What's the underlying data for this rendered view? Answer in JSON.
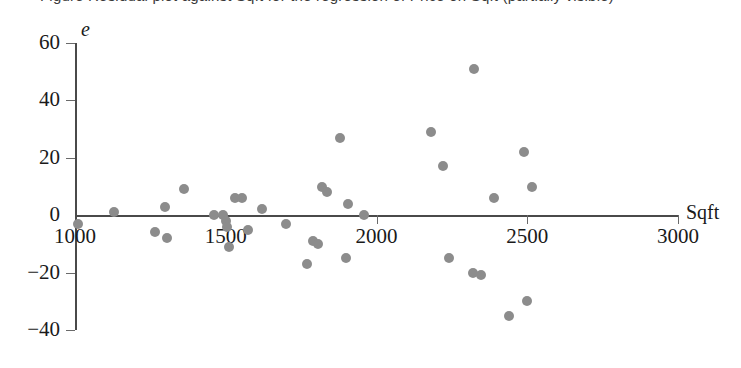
{
  "caption": {
    "text": "Figure  Residual plot against Sqft for the regression of Price on Sqft (partially visible)"
  },
  "chart_data": {
    "type": "scatter",
    "title": "",
    "subtitle": "",
    "xlabel": "Sqft",
    "ylabel": "e",
    "xlim": [
      1000,
      3000
    ],
    "ylim": [
      -40,
      60
    ],
    "xticks": [
      1000,
      1500,
      2000,
      2500,
      3000
    ],
    "xtick_labels": [
      "1000",
      "1500",
      "2000",
      "2500",
      "3000"
    ],
    "yticks": [
      -40,
      -20,
      0,
      20,
      40,
      60
    ],
    "ytick_labels": [
      "−40",
      "−20",
      "0",
      "20",
      "40",
      "60"
    ],
    "grid": false,
    "legend": "none",
    "marker_color": "#8c8c8c",
    "axis_color": "#4a4a4a",
    "series": [
      {
        "name": "residuals",
        "points": [
          {
            "x": 1010,
            "y": -3
          },
          {
            "x": 1130,
            "y": 1
          },
          {
            "x": 1265,
            "y": -6
          },
          {
            "x": 1300,
            "y": 3
          },
          {
            "x": 1305,
            "y": -8
          },
          {
            "x": 1360,
            "y": 9
          },
          {
            "x": 1460,
            "y": 0
          },
          {
            "x": 1490,
            "y": 0
          },
          {
            "x": 1500,
            "y": -2
          },
          {
            "x": 1505,
            "y": -4
          },
          {
            "x": 1512,
            "y": -11
          },
          {
            "x": 1530,
            "y": 6
          },
          {
            "x": 1555,
            "y": 6
          },
          {
            "x": 1575,
            "y": -5
          },
          {
            "x": 1620,
            "y": 2
          },
          {
            "x": 1700,
            "y": -3
          },
          {
            "x": 1790,
            "y": -9
          },
          {
            "x": 1805,
            "y": -10
          },
          {
            "x": 1820,
            "y": 10
          },
          {
            "x": 1835,
            "y": 8
          },
          {
            "x": 1770,
            "y": -17
          },
          {
            "x": 1880,
            "y": 27
          },
          {
            "x": 1905,
            "y": 4
          },
          {
            "x": 1900,
            "y": -15
          },
          {
            "x": 1960,
            "y": 0
          },
          {
            "x": 2180,
            "y": 29
          },
          {
            "x": 2220,
            "y": 17
          },
          {
            "x": 2240,
            "y": -15
          },
          {
            "x": 2325,
            "y": 51
          },
          {
            "x": 2320,
            "y": -20
          },
          {
            "x": 2345,
            "y": -21
          },
          {
            "x": 2390,
            "y": 6
          },
          {
            "x": 2440,
            "y": -35
          },
          {
            "x": 2490,
            "y": 22
          },
          {
            "x": 2500,
            "y": -30
          },
          {
            "x": 2515,
            "y": 10
          }
        ]
      }
    ]
  }
}
